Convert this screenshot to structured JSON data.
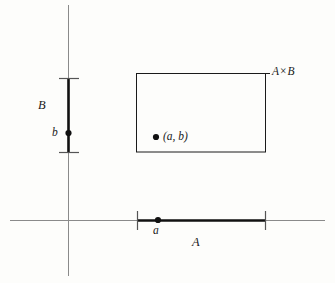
{
  "figure": {
    "background_color": "#fdfdfb",
    "axis_color": "#8a8a8a",
    "ink_color": "#1a1a1a"
  },
  "labels": {
    "set_b_vertical": "B",
    "element_b": "b",
    "set_a_horizontal": "A",
    "element_a": "a",
    "ordered_pair": "(a, b)",
    "product_set": "A × B",
    "product_set_left": "A",
    "product_set_times": "×",
    "product_set_right": "B"
  },
  "geometry": {
    "x_axis": {
      "y": 220,
      "x_start": 10,
      "x_end": 325
    },
    "y_axis": {
      "x": 68,
      "y_start": 5,
      "y_end": 276
    },
    "segment_A": {
      "y": 220,
      "x_start": 137,
      "x_end": 265
    },
    "segment_B": {
      "x": 68,
      "y_start": 78,
      "y_end": 152
    },
    "point_a": {
      "x": 158,
      "y": 220
    },
    "point_b": {
      "x": 68,
      "y": 133
    },
    "point_ab": {
      "x": 156,
      "y": 137
    },
    "rectangle": {
      "x": 136,
      "y": 73,
      "width": 130,
      "height": 79
    }
  }
}
